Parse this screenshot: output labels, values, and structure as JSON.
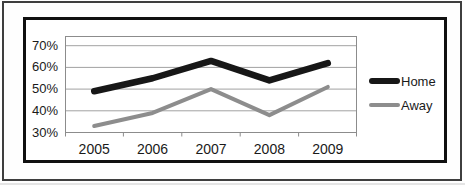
{
  "chart_data": {
    "type": "line",
    "title": "",
    "xlabel": "",
    "ylabel": "",
    "categories": [
      "2005",
      "2006",
      "2007",
      "2008",
      "2009"
    ],
    "series": [
      {
        "name": "Home",
        "values": [
          49,
          55,
          63,
          54,
          62
        ],
        "color": "#171717",
        "stroke_width": 6.5
      },
      {
        "name": "Away",
        "values": [
          33,
          39,
          50,
          38,
          51
        ],
        "color": "#8d8d8d",
        "stroke_width": 4
      }
    ],
    "y_ticks": [
      {
        "label": "30%",
        "value": 30
      },
      {
        "label": "40%",
        "value": 40
      },
      {
        "label": "50%",
        "value": 50
      },
      {
        "label": "60%",
        "value": 60
      },
      {
        "label": "70%",
        "value": 70
      }
    ],
    "ylim": [
      30,
      74.5
    ],
    "grid": true,
    "legend_position": "right"
  },
  "colors": {
    "gridline": "#a2a2a2",
    "plot_border": "#8c8c8c",
    "chart_frame_border": "#101010",
    "scan_border": "#3e3e3e",
    "text": "#1a1a1a",
    "background": "#ffffff"
  }
}
